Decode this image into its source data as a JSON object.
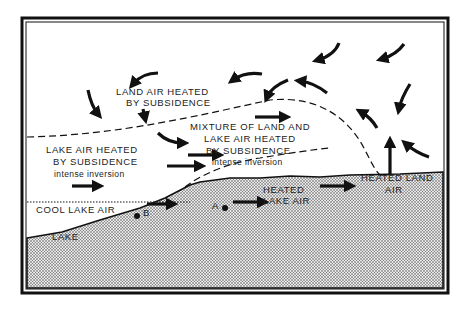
{
  "diagram": {
    "labels": {
      "land_air_1": "LAND AIR HEATED",
      "land_air_2": "BY SUBSIDENCE",
      "mixture_1": "MIXTURE OF LAND AND",
      "mixture_2": "LAKE AIR HEATED",
      "mixture_3": "BY SUBSIDENCE",
      "mixture_4": "intense inversion",
      "lake_air_1": "LAKE AIR HEATED",
      "lake_air_2": "BY SUBSIDENCE",
      "lake_air_3": "intense inversion",
      "heated_land_1": "HEATED LAND",
      "heated_land_2": "AIR",
      "heated_lake_1": "HEATED",
      "heated_lake_2": "LAKE AIR",
      "cool_lake_air": "COOL LAKE AIR",
      "lake": "LAKE",
      "point_a": "A",
      "point_b": "B"
    },
    "colors": {
      "ink": "#111111",
      "ground_fill": "#bdbdbd",
      "background": "#ffffff"
    }
  }
}
